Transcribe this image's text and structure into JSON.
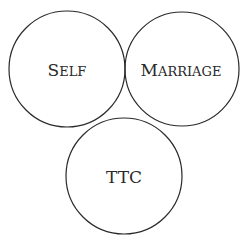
{
  "diagram": {
    "type": "three-circle",
    "circles": [
      {
        "id": "self",
        "label_initial": "S",
        "label_rest": "ELF",
        "label": "Self"
      },
      {
        "id": "marriage",
        "label_initial": "M",
        "label_rest": "ARRIAGE",
        "label": "Marriage"
      },
      {
        "id": "ttc",
        "label": "TTC"
      }
    ],
    "stroke_color": "#2a2a2a",
    "background": "#ffffff"
  }
}
